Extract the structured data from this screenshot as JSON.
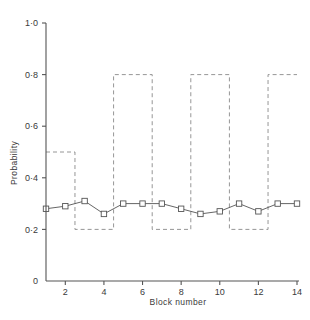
{
  "chart_data": {
    "type": "line",
    "title": "",
    "xlabel": "Block number",
    "ylabel": "Probability",
    "xlim": [
      1,
      14
    ],
    "ylim": [
      0,
      1.0
    ],
    "grid": false,
    "legend": "none",
    "x": [
      1,
      2,
      3,
      4,
      5,
      6,
      7,
      8,
      9,
      10,
      11,
      12,
      13,
      14
    ],
    "categories": [
      "1",
      "2",
      "3",
      "4",
      "5",
      "6",
      "7",
      "8",
      "9",
      "10",
      "11",
      "12",
      "13",
      "14"
    ],
    "values": [
      0.28,
      0.29,
      0.31,
      0.26,
      0.3,
      0.3,
      0.3,
      0.28,
      0.26,
      0.27,
      0.3,
      0.27,
      0.3,
      0.3
    ],
    "series": [
      {
        "name": "observed-probability",
        "marker": "open-square",
        "linestyle": "solid",
        "color": "#555555",
        "x": [
          1,
          2,
          3,
          4,
          5,
          6,
          7,
          8,
          9,
          10,
          11,
          12,
          13,
          14
        ],
        "values": [
          0.28,
          0.29,
          0.31,
          0.26,
          0.3,
          0.3,
          0.3,
          0.28,
          0.26,
          0.27,
          0.3,
          0.27,
          0.3,
          0.3
        ]
      },
      {
        "name": "programmed-probability",
        "marker": "none",
        "linestyle": "dashed",
        "color": "#8a8a8a",
        "steps": [
          {
            "x_start": 1.0,
            "x_end": 2.5,
            "y": 0.5
          },
          {
            "x_start": 2.5,
            "x_end": 4.5,
            "y": 0.2
          },
          {
            "x_start": 4.5,
            "x_end": 6.5,
            "y": 0.8
          },
          {
            "x_start": 6.5,
            "x_end": 8.5,
            "y": 0.2
          },
          {
            "x_start": 8.5,
            "x_end": 10.5,
            "y": 0.8
          },
          {
            "x_start": 10.5,
            "x_end": 12.5,
            "y": 0.2
          },
          {
            "x_start": 12.5,
            "x_end": 14.0,
            "y": 0.8
          }
        ]
      }
    ],
    "yticks": [
      0,
      0.2,
      0.4,
      0.6,
      0.8,
      1.0
    ],
    "ytick_labels": [
      "0",
      "0·2",
      "0·4",
      "0·6",
      "0·8",
      "1·0"
    ],
    "xticks": [
      2,
      4,
      6,
      8,
      10,
      12,
      14
    ],
    "xtick_labels": [
      "2",
      "4",
      "6",
      "8",
      "10",
      "12",
      "14"
    ],
    "axis_color": "#555555",
    "text_color": "#3a3a3a",
    "background": "#ffffff"
  }
}
